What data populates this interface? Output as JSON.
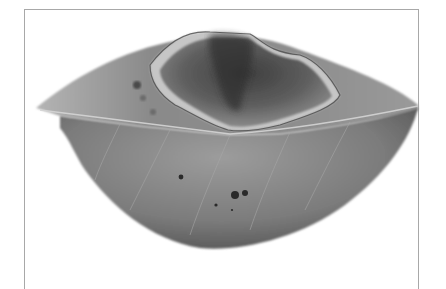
{
  "image": {
    "subject": "Diseased leaf with large necrotic lesion and small dark spots",
    "alt": "Grayscale photograph of a leaf with a large necrotic lesion near the upper midrib and several small dark spots on the lower half",
    "colors": {
      "background": "#ffffff",
      "frame": "#a8a8a8",
      "leaf_mid": "#8e8e8e",
      "leaf_dark": "#5a5a5a",
      "lesion_dark": "#3a3a3a",
      "lesion_light": "#c8c8c8",
      "midrib": "#d0d0d0"
    }
  }
}
